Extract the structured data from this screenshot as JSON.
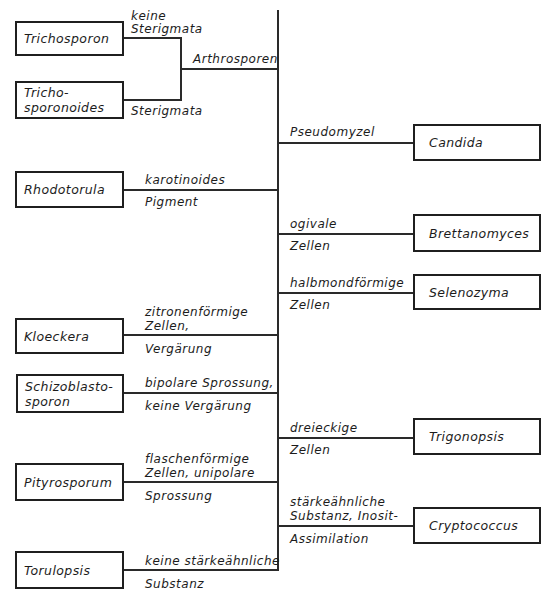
{
  "diagram": {
    "type": "dichotomous identification key",
    "genera": {
      "trichosporon": "Trichosporon",
      "trichosporonoides_1": "Tricho-",
      "trichosporonoides_2": "sporonoides",
      "rhodotorula": "Rhodotorula",
      "kloeckera": "Kloeckera",
      "schizoblastosporon_1": "Schizoblasto-",
      "schizoblastosporon_2": "sporon",
      "pityrosporum": "Pityrosporum",
      "torulopsis": "Torulopsis",
      "candida": "Candida",
      "brettanomyces": "Brettanomyces",
      "selenozyma": "Selenozyma",
      "trigonopsis": "Trigonopsis",
      "cryptococcus": "Cryptococcus"
    },
    "criteria": {
      "keine_sterigmata_1": "keine",
      "keine_sterigmata_2": "Sterigmata",
      "sterigmata": "Sterigmata",
      "arthrosporen": "Arthrosporen",
      "karotinoides": "karotinoides",
      "pigment": "Pigment",
      "pseudomyzel": "Pseudomyzel",
      "ogivale": "ogivale",
      "ogivale_zellen": "Zellen",
      "halbmond": "halbmondförmige",
      "halbmond_zellen": "Zellen",
      "zitronen_1": "zitronenförmige",
      "zitronen_2": "Zellen,",
      "vergaerung": "Vergärung",
      "bipolare": "bipolare Sprossung,",
      "keine_vergaerung": "keine Vergärung",
      "dreieckige": "dreieckige",
      "dreieckige_zellen": "Zellen",
      "flaschen_1": "flaschenförmige",
      "flaschen_2": "Zellen, unipolare",
      "sprossung": "Sprossung",
      "staerke_1": "stärkeähnliche",
      "staerke_2": "Substanz, Inosit-",
      "assimilation": "Assimilation",
      "keine_staerke": "keine stärkeähnliche",
      "substanz": "Substanz"
    }
  }
}
